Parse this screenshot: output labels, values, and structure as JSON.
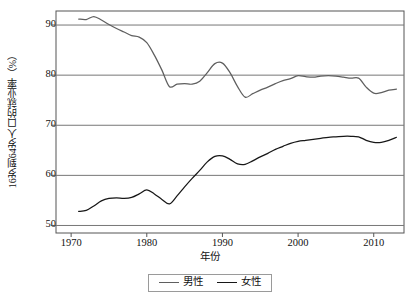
{
  "figure": {
    "background": "#ffffff",
    "frame_color": "#555555"
  },
  "axis": {
    "ylabel": "16岁到64岁人口的就业率（%）",
    "xlabel": "年份",
    "yticks": [
      "50",
      "60",
      "70",
      "80",
      "90"
    ],
    "xticks": [
      "1970",
      "1980",
      "1990",
      "2000",
      "2010"
    ]
  },
  "legend": {
    "items": [
      {
        "label": "男性",
        "color": "#5f5f5f"
      },
      {
        "label": "女性",
        "color": "#171717"
      }
    ]
  },
  "chart_data": {
    "type": "line",
    "title": "",
    "xlabel": "年份",
    "ylabel": "16岁到64岁人口的就业率（%）",
    "xlim": [
      1968,
      2014
    ],
    "ylim": [
      48.5,
      92.8
    ],
    "xticks": [
      1970,
      1980,
      1990,
      2000,
      2010
    ],
    "yticks": [
      50,
      60,
      70,
      80,
      90
    ],
    "grid": "horizontal",
    "legend_position": "below-axes",
    "x": [
      1971,
      1972,
      1973,
      1974,
      1975,
      1976,
      1977,
      1978,
      1979,
      1980,
      1981,
      1982,
      1983,
      1984,
      1985,
      1986,
      1987,
      1988,
      1989,
      1990,
      1991,
      1992,
      1993,
      1994,
      1995,
      1996,
      1997,
      1998,
      1999,
      2000,
      2001,
      2002,
      2003,
      2004,
      2005,
      2006,
      2007,
      2008,
      2009,
      2010,
      2011,
      2012,
      2013
    ],
    "series": [
      {
        "name": "男性",
        "color": "#5f5f5f",
        "values": [
          91.2,
          91.1,
          91.7,
          91.0,
          90.1,
          89.3,
          88.6,
          87.9,
          87.6,
          86.5,
          84.0,
          81.0,
          77.7,
          78.2,
          78.3,
          78.2,
          78.8,
          80.5,
          82.3,
          82.4,
          80.5,
          77.7,
          75.6,
          76.3,
          77.0,
          77.6,
          78.3,
          78.9,
          79.3,
          79.9,
          79.7,
          79.6,
          79.8,
          79.9,
          79.8,
          79.6,
          79.4,
          79.4,
          77.6,
          76.4,
          76.5,
          77.0,
          77.2
        ]
      },
      {
        "name": "女性",
        "color": "#171717",
        "values": [
          52.8,
          53.0,
          53.9,
          54.9,
          55.4,
          55.5,
          55.4,
          55.6,
          56.3,
          57.1,
          56.3,
          55.2,
          54.3,
          55.9,
          57.7,
          59.4,
          61.0,
          62.7,
          63.8,
          63.9,
          63.2,
          62.3,
          62.2,
          62.9,
          63.7,
          64.4,
          65.2,
          65.8,
          66.4,
          66.8,
          67.0,
          67.2,
          67.4,
          67.6,
          67.7,
          67.8,
          67.8,
          67.7,
          67.0,
          66.6,
          66.6,
          67.0,
          67.6
        ]
      }
    ]
  }
}
